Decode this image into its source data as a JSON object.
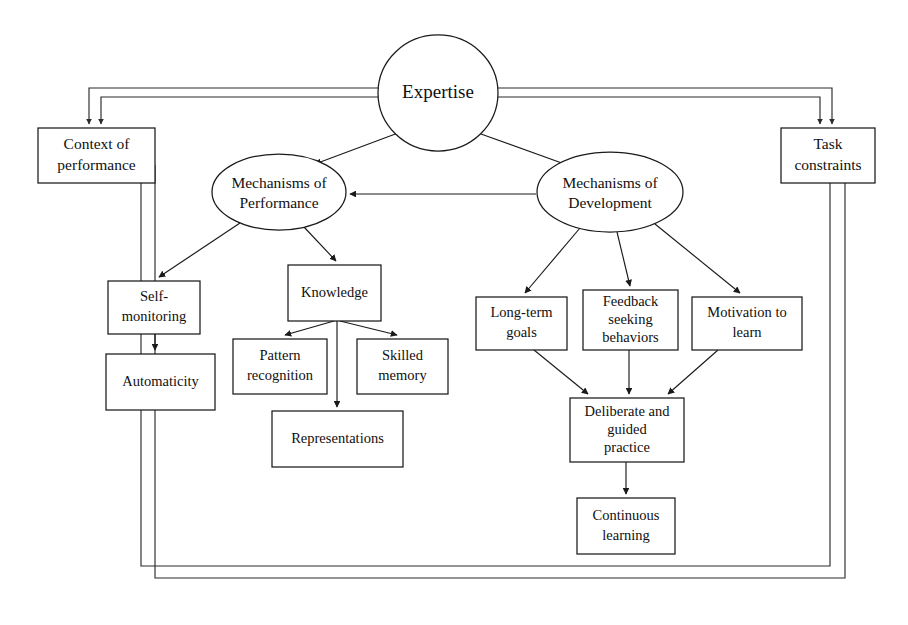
{
  "diagram": {
    "type": "node-link concept diagram",
    "stroke_color": "#1a1a1a",
    "fill_color": "#ffffff",
    "nodes": {
      "expertise": {
        "label": "Expertise",
        "shape": "ellipse",
        "cx": 438,
        "cy": 93,
        "rx": 60,
        "ry": 58
      },
      "context": {
        "line1": "Context of",
        "line2": "performance",
        "shape": "rect",
        "x": 38,
        "y": 128,
        "w": 117,
        "h": 55
      },
      "task": {
        "line1": "Task",
        "line2": "constraints",
        "shape": "rect",
        "x": 781,
        "y": 128,
        "w": 94,
        "h": 55
      },
      "mech_performance": {
        "line1": "Mechanisms of",
        "line2": "Performance",
        "shape": "ellipse",
        "cx": 279,
        "cy": 192,
        "rx": 67,
        "ry": 38
      },
      "mech_development": {
        "line1": "Mechanisms of",
        "line2": "Development",
        "shape": "ellipse",
        "cx": 610,
        "cy": 192,
        "rx": 73,
        "ry": 40
      },
      "self_monitoring": {
        "line1": "Self-",
        "line2": "monitoring",
        "shape": "rect",
        "x": 108,
        "y": 281,
        "w": 92,
        "h": 53
      },
      "automaticity": {
        "line1": "Automaticity",
        "line2": "",
        "shape": "rect",
        "x": 106,
        "y": 354,
        "w": 109,
        "h": 56
      },
      "knowledge": {
        "line1": "Knowledge",
        "line2": "",
        "shape": "rect",
        "x": 288,
        "y": 265,
        "w": 93,
        "h": 56
      },
      "pattern": {
        "line1": "Pattern",
        "line2": "recognition",
        "shape": "rect",
        "x": 233,
        "y": 339,
        "w": 94,
        "h": 55
      },
      "skilled_memory": {
        "line1": "Skilled",
        "line2": "memory",
        "shape": "rect",
        "x": 357,
        "y": 339,
        "w": 91,
        "h": 55
      },
      "representations": {
        "line1": "Representations",
        "line2": "",
        "shape": "rect",
        "x": 272,
        "y": 411,
        "w": 131,
        "h": 56
      },
      "long_term": {
        "line1": "Long-term",
        "line2": "goals",
        "shape": "rect",
        "x": 476,
        "y": 297,
        "w": 91,
        "h": 53
      },
      "feedback": {
        "line1": "Feedback",
        "line2": "seeking",
        "line3": "behaviors",
        "shape": "rect",
        "x": 583,
        "y": 290,
        "w": 95,
        "h": 60
      },
      "motivation": {
        "line1": "Motivation to",
        "line2": "learn",
        "shape": "rect",
        "x": 692,
        "y": 297,
        "w": 110,
        "h": 53
      },
      "deliberate": {
        "line1": "Deliberate and",
        "line2": "guided",
        "line3": "practice",
        "shape": "rect",
        "x": 570,
        "y": 398,
        "w": 114,
        "h": 64
      },
      "continuous": {
        "line1": "Continuous",
        "line2": "learning",
        "shape": "rect",
        "x": 577,
        "y": 498,
        "w": 98,
        "h": 56
      }
    },
    "edges": [
      {
        "id": "expertise-to-performance",
        "from": "expertise",
        "to": "mech_performance",
        "kind": "arrow"
      },
      {
        "id": "expertise-to-development",
        "from": "expertise",
        "to": "mech_development",
        "kind": "arrow"
      },
      {
        "id": "development-to-performance",
        "from": "mech_development",
        "to": "mech_performance",
        "kind": "arrow"
      },
      {
        "id": "expertise-to-context-outer",
        "from": "expertise",
        "to": "context",
        "kind": "elbow-arrow"
      },
      {
        "id": "expertise-to-context-inner",
        "from": "expertise",
        "to": "context",
        "kind": "elbow-arrow"
      },
      {
        "id": "expertise-to-task-outer",
        "from": "expertise",
        "to": "task",
        "kind": "elbow-arrow"
      },
      {
        "id": "expertise-to-task-inner",
        "from": "expertise",
        "to": "task",
        "kind": "elbow-arrow"
      },
      {
        "id": "performance-to-selfmonitoring",
        "from": "mech_performance",
        "to": "self_monitoring",
        "kind": "arrow"
      },
      {
        "id": "performance-to-knowledge",
        "from": "mech_performance",
        "to": "knowledge",
        "kind": "arrow"
      },
      {
        "id": "selfmonitoring-to-automaticity",
        "from": "self_monitoring",
        "to": "automaticity",
        "kind": "arrow"
      },
      {
        "id": "knowledge-to-pattern",
        "from": "knowledge",
        "to": "pattern",
        "kind": "arrow"
      },
      {
        "id": "knowledge-to-representations",
        "from": "knowledge",
        "to": "representations",
        "kind": "arrow"
      },
      {
        "id": "knowledge-to-skilledmemory",
        "from": "knowledge",
        "to": "skilled_memory",
        "kind": "arrow"
      },
      {
        "id": "development-to-longterm",
        "from": "mech_development",
        "to": "long_term",
        "kind": "arrow"
      },
      {
        "id": "development-to-feedback",
        "from": "mech_development",
        "to": "feedback",
        "kind": "arrow"
      },
      {
        "id": "development-to-motivation",
        "from": "mech_development",
        "to": "motivation",
        "kind": "arrow"
      },
      {
        "id": "longterm-to-deliberate",
        "from": "long_term",
        "to": "deliberate",
        "kind": "arrow"
      },
      {
        "id": "feedback-to-deliberate",
        "from": "feedback",
        "to": "deliberate",
        "kind": "arrow"
      },
      {
        "id": "motivation-to-deliberate",
        "from": "motivation",
        "to": "deliberate",
        "kind": "arrow"
      },
      {
        "id": "deliberate-to-continuous",
        "from": "deliberate",
        "to": "continuous",
        "kind": "arrow"
      }
    ],
    "frames": [
      {
        "id": "outer-frame",
        "x": 65,
        "y": 88,
        "w": 780,
        "h": 490
      },
      {
        "id": "inner-frame",
        "x": 80,
        "y": 101,
        "w": 750,
        "h": 465
      }
    ]
  }
}
